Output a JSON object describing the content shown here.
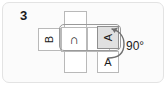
{
  "figure": {
    "number": "3",
    "type": "cube-net-rotation-diagram",
    "caption_present": false
  },
  "colors": {
    "frame_border": "#e3e3e3",
    "panel_background": "#fbfbfb",
    "cell_border": "#b9b9b9",
    "cell_fill": "#ffffff",
    "shaded_cell_fill": "#e0e0e0",
    "shaded_cell_border": "#8f8f8f",
    "band_border": "#9a9a9a",
    "ink": "#1b1b1b"
  },
  "net": {
    "description": "cross-shaped net of squares",
    "cells": [
      {
        "id": "cell-top",
        "label": "",
        "rotation": 0,
        "shaded": false,
        "x": 64,
        "y": 11,
        "w": 23,
        "h": 20
      },
      {
        "id": "cell-b",
        "label": "B",
        "rotation": -90,
        "shaded": false,
        "x": 38,
        "y": 28,
        "w": 23,
        "h": 23
      },
      {
        "id": "cell-arch",
        "label": "∩",
        "rotation": 0,
        "shaded": false,
        "x": 61,
        "y": 27,
        "w": 26,
        "h": 25
      },
      {
        "id": "cell-middle",
        "label": "",
        "rotation": 0,
        "shaded": false,
        "x": 87,
        "y": 27,
        "w": 23,
        "h": 25
      },
      {
        "id": "cell-a-rotated",
        "label": "A",
        "rotation": -90,
        "shaded": true,
        "x": 97,
        "y": 26,
        "w": 22,
        "h": 23
      },
      {
        "id": "cell-bottom",
        "label": "",
        "rotation": 0,
        "shaded": false,
        "x": 64,
        "y": 51,
        "w": 23,
        "h": 22
      },
      {
        "id": "cell-a-upright",
        "label": "A",
        "rotation": 0,
        "shaded": false,
        "x": 97,
        "y": 51,
        "w": 22,
        "h": 22
      }
    ],
    "band": {
      "id": "highlight-band",
      "x": 59,
      "y": 24,
      "w": 62,
      "h": 27
    }
  },
  "annotation": {
    "rotation_arrow": {
      "name": "rotation-arrow",
      "direction": "counterclockwise-up",
      "from": "cell-a-upright",
      "to": "cell-a-rotated"
    },
    "angle_label": "90°"
  }
}
